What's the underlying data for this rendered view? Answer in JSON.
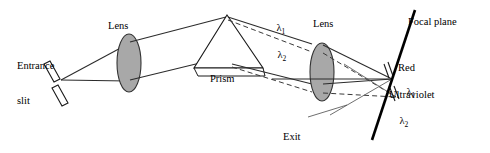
{
  "diagram": {
    "colors": {
      "ink": "#1a1a1a",
      "lens_fill": "#a8a8a8",
      "lens_stroke": "#333333",
      "ray_solid": "#2b2b2b",
      "ray_dashed": "#3a3a3a",
      "focal_plane": "#000000",
      "background": "#ffffff"
    },
    "labels": {
      "entrance_slit_line1": "Entrance",
      "entrance_slit_line2": "slit",
      "lens_left": "Lens",
      "lens_right": "Lens",
      "prism": "Prism",
      "lambda1_prism": "λ",
      "lambda1_prism_sub": "1",
      "lambda2_prism": "λ",
      "lambda2_prism_sub": "2",
      "focal_plane": "Focal plane",
      "red": "Red",
      "lambda1_focal": "λ",
      "lambda1_focal_sub": "1",
      "ultraviolet": "Ultraviolet",
      "lambda2_focal": "λ",
      "lambda2_focal_sub": "2",
      "exit_slit_line1": "Exit",
      "exit_slit_line2": "slit"
    }
  }
}
